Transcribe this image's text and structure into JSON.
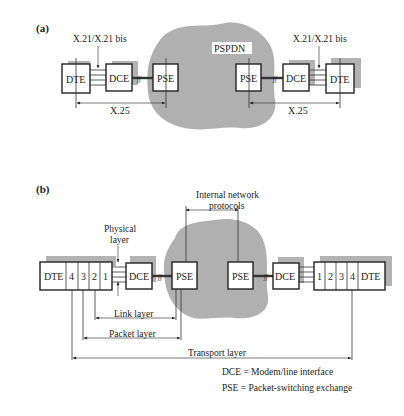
{
  "panel_a": {
    "label": "(a)",
    "network": "PSPDN",
    "left": {
      "dte": "DTE",
      "dce": "DCE",
      "pse": "PSE",
      "interface": "X.21/X.21 bis",
      "protocol": "X.25"
    },
    "right": {
      "dte": "DTE",
      "dce": "DCE",
      "pse": "PSE",
      "interface": "X.21/X.21 bis",
      "protocol": "X.25"
    }
  },
  "panel_b": {
    "label": "(b)",
    "internal_label_1": "Internal network",
    "internal_label_2": "protocols",
    "physical_1": "Physical",
    "physical_2": "layer",
    "left": {
      "dte": "DTE",
      "layers": [
        "4",
        "3",
        "2",
        "1"
      ],
      "dce": "DCE",
      "pse": "PSE"
    },
    "right": {
      "dte": "DTE",
      "layers": [
        "1",
        "2",
        "3",
        "4"
      ],
      "dce": "DCE",
      "pse": "PSE"
    },
    "spans": {
      "link": "Link layer",
      "packet": "Packet layer",
      "transport": "Transport layer"
    }
  },
  "legend": [
    {
      "term": "DCE",
      "definition": "DCE = Modem/line interface"
    },
    {
      "term": "PSE",
      "definition": "PSE = Packet-switching exchange"
    }
  ]
}
